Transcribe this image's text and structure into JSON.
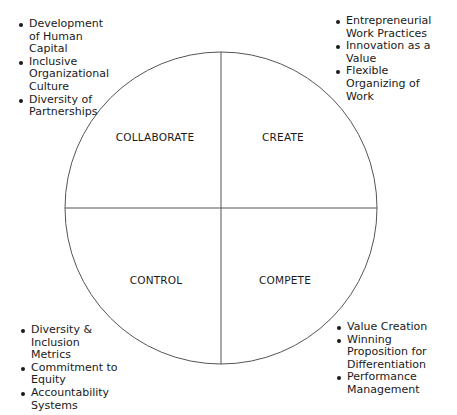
{
  "diagram": {
    "type": "quadrant-circle",
    "quadrants": {
      "top_left": "COLLABORATE",
      "top_right": "CREATE",
      "bottom_left": "CONTROL",
      "bottom_right": "COMPETE"
    },
    "lists": {
      "top_left": [
        "Development of Human Capital",
        "Inclusive Organizational Culture",
        "Diversity of Partnerships"
      ],
      "top_right": [
        "Entrepreneurial Work Practices",
        "Innovation as a Value",
        "Flexible Organizing of Work"
      ],
      "bottom_left": [
        "Diversity & Inclusion Metrics",
        "Commitment to Equity",
        "Accountability Systems"
      ],
      "bottom_right": [
        "Value Creation",
        "Winning Proposition for Differentiation",
        "Performance Management"
      ]
    },
    "colors": {
      "line": "#555555",
      "text": "#1a1a1a",
      "background": "#ffffff"
    }
  }
}
